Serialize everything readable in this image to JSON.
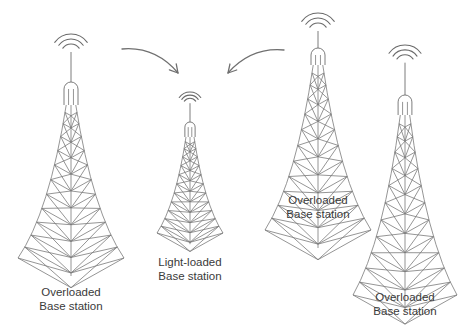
{
  "figure": {
    "background": "#ffffff",
    "line_color": "#7a7a7a",
    "text_color": "#3a3a3a"
  },
  "towers": [
    {
      "id": "tower-left",
      "status": "overloaded",
      "label_line1": "Overloaded",
      "label_line2": "Base station",
      "cx": 71,
      "wave_top": 34,
      "cap_top": 82,
      "lattice_top": 105,
      "base_y": 258,
      "half_width": 53,
      "label_x": 71,
      "label_y": 285
    },
    {
      "id": "tower-middle",
      "status": "light-loaded",
      "label_line1": "Light-loaded",
      "label_line2": "Base station",
      "cx": 190,
      "wave_top": 92,
      "cap_top": 122,
      "lattice_top": 137,
      "base_y": 233,
      "half_width": 33,
      "label_x": 190,
      "label_y": 255
    },
    {
      "id": "tower-center-right",
      "status": "overloaded",
      "label_line1": "Overloaded",
      "label_line2": "Base station",
      "cx": 318,
      "wave_top": 13,
      "cap_top": 48,
      "lattice_top": 65,
      "base_y": 230,
      "half_width": 53,
      "label_x": 318,
      "label_y": 193
    },
    {
      "id": "tower-right",
      "status": "overloaded",
      "label_line1": "Overloaded",
      "label_line2": "Base station",
      "cx": 405,
      "wave_top": 45,
      "cap_top": 95,
      "lattice_top": 115,
      "base_y": 295,
      "half_width": 52,
      "label_x": 405,
      "label_y": 290
    }
  ],
  "arrows": [
    {
      "id": "arrow-left-to-middle",
      "from": [
        122,
        49
      ],
      "ctrl": [
        155,
        46
      ],
      "to": [
        178,
        73
      ],
      "direction": "down-right"
    },
    {
      "id": "arrow-right-to-middle",
      "from": [
        284,
        50
      ],
      "ctrl": [
        251,
        47
      ],
      "to": [
        228,
        73
      ],
      "direction": "down-left"
    }
  ]
}
